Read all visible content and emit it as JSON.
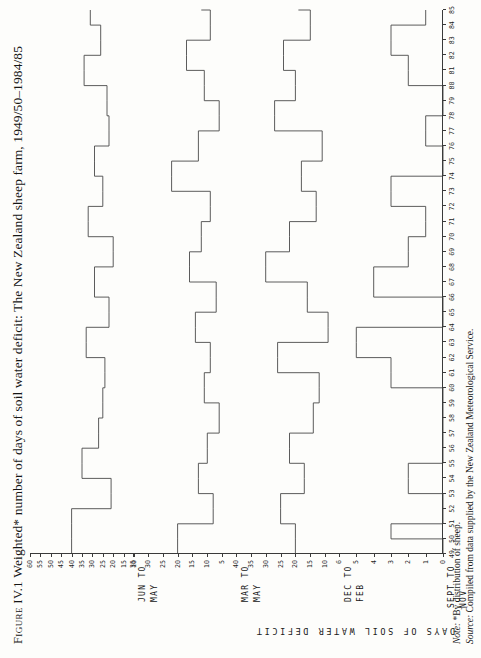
{
  "figure": {
    "number": "Figure IV.1",
    "title_main": "Weighted* number of days of soil water deficit: The New Zealand sheep farm, 1949/50–1984/85",
    "full_title": "Figure IV.1  Weighted* number of days of soil water deficit: The New Zealand sheep farm, 1949/50–1984/85"
  },
  "axis": {
    "y_title": "DAYS OF SOIL WATER DEFICIT",
    "x_title": ""
  },
  "notes": {
    "note_label": "Note:",
    "note_text": "*By distribution of sheep.",
    "source_label": "Source:",
    "source_text": "Compiled from data supplied by the New Zealand Meteorological Service."
  },
  "chart_data": {
    "type": "line",
    "title": "Weighted* number of days of soil water deficit: The New Zealand sheep farm, 1949/50–1984/85",
    "xlabel": "",
    "ylabel": "DAYS OF SOIL WATER DEFICIT",
    "grid": false,
    "legend": "none",
    "drawstyle": "steps-post",
    "x": [
      49,
      50,
      51,
      52,
      53,
      54,
      55,
      56,
      57,
      58,
      59,
      60,
      61,
      62,
      63,
      64,
      65,
      66,
      67,
      68,
      69,
      70,
      71,
      72,
      73,
      74,
      75,
      76,
      77,
      78,
      79,
      80,
      81,
      82,
      83,
      84,
      85
    ],
    "xtick_labels": [
      "49",
      "50",
      "51",
      "52",
      "53",
      "54",
      "55",
      "56",
      "57",
      "58",
      "59",
      "60",
      "61",
      "62",
      "63",
      "64",
      "65",
      "66",
      "67",
      "68",
      "69",
      "70",
      "71",
      "72",
      "73",
      "74",
      "75",
      "76",
      "77",
      "78",
      "79",
      "80",
      "81",
      "82",
      "83",
      "84",
      "85"
    ],
    "panels": [
      {
        "id": "jun-to-may",
        "label_line1": "JUN TO",
        "label_line2": "MAY",
        "ylim": [
          10,
          60
        ],
        "yticks": [
          60,
          55,
          50,
          45,
          40,
          35,
          30,
          25,
          20,
          15,
          10
        ],
        "ytick_labels": [
          "60",
          "55",
          "50",
          "45",
          "40",
          "35",
          "30",
          "25",
          "20",
          "15",
          "10"
        ],
        "values": [
          40,
          40,
          40,
          21,
          21,
          35,
          35,
          27,
          27,
          25,
          25,
          24,
          24,
          33,
          33,
          22,
          22,
          29,
          29,
          20,
          20,
          32,
          32,
          25,
          25,
          29,
          29,
          22,
          22,
          23,
          23,
          34,
          34,
          26,
          26,
          31,
          31
        ]
      },
      {
        "id": "mar-to-may",
        "label_line1": "MAR TO",
        "label_line2": "MAY",
        "ylim": [
          0,
          35
        ],
        "yticks": [
          35,
          30,
          25,
          20,
          15,
          10,
          5
        ],
        "ytick_labels": [
          "35",
          "30",
          "25",
          "20",
          "15",
          "10",
          "5"
        ],
        "values": [
          20,
          20,
          8,
          8,
          13,
          13,
          10,
          10,
          6,
          6,
          11,
          11,
          9,
          9,
          14,
          14,
          7,
          7,
          16,
          16,
          12,
          12,
          9,
          9,
          22,
          22,
          13,
          13,
          6,
          6,
          11,
          11,
          17,
          17,
          9,
          9,
          12
        ]
      },
      {
        "id": "dec-to-feb",
        "label_line1": "DEC TO",
        "label_line2": "FEB",
        "ylim": [
          5,
          40
        ],
        "yticks": [
          40,
          35,
          30,
          25,
          20,
          15,
          10
        ],
        "ytick_labels": [
          "40",
          "35",
          "30",
          "25",
          "20",
          "15",
          "10"
        ],
        "values": [
          20,
          20,
          25,
          25,
          17,
          17,
          22,
          22,
          14,
          14,
          12,
          12,
          26,
          26,
          9,
          9,
          16,
          16,
          30,
          30,
          22,
          22,
          13,
          13,
          18,
          18,
          11,
          11,
          27,
          27,
          20,
          20,
          24,
          24,
          15,
          15,
          19
        ]
      },
      {
        "id": "sept-to-nov",
        "label_line1": "SEPT TO",
        "label_line2": "NOV",
        "ylim": [
          0,
          6
        ],
        "yticks": [
          6,
          5,
          4,
          3,
          2,
          1,
          0
        ],
        "ytick_labels": [
          "6",
          "5",
          "4",
          "3",
          "2",
          "1",
          "0"
        ],
        "values": [
          0,
          3,
          0,
          0,
          2,
          2,
          0,
          0,
          0,
          0,
          0,
          3,
          3,
          5,
          5,
          0,
          0,
          4,
          4,
          2,
          2,
          1,
          1,
          3,
          3,
          0,
          0,
          1,
          1,
          0,
          0,
          2,
          2,
          3,
          3,
          1,
          1
        ]
      }
    ]
  },
  "colors": {
    "ink": "#3a3a3a",
    "paper": "#fdfdfb",
    "text": "#151515"
  }
}
